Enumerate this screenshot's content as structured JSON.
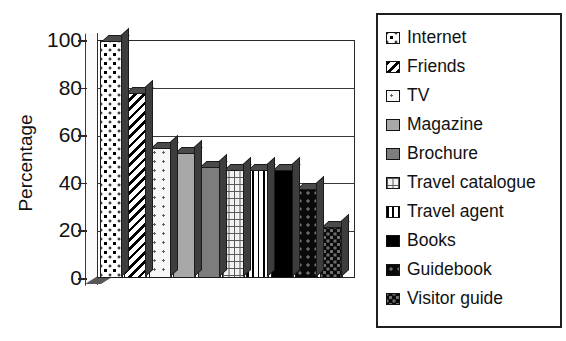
{
  "chart_data": {
    "type": "bar",
    "title": "",
    "xlabel": "",
    "ylabel": "Percentage",
    "ylim": [
      0,
      100
    ],
    "yticks": [
      0,
      20,
      40,
      60,
      80,
      100
    ],
    "grid": true,
    "legend_position": "right",
    "categories": [
      "Internet",
      "Friends",
      "TV",
      "Magazine",
      "Brochure",
      "Travel catalogue",
      "Travel agent",
      "Books",
      "Guidebook",
      "Visitor guide"
    ],
    "values": [
      100,
      78,
      55,
      53,
      47,
      46,
      46,
      46,
      38,
      22
    ]
  },
  "axis": {
    "y_title": "Percentage",
    "tick_labels": [
      "100",
      "80",
      "60",
      "40",
      "20",
      "0"
    ]
  },
  "legend": {
    "items": [
      {
        "label": "Internet",
        "pattern": "dot-cross",
        "swatch_class": "p-internet"
      },
      {
        "label": "Friends",
        "pattern": "diagonal-hatch",
        "swatch_class": "p-friends"
      },
      {
        "label": "TV",
        "pattern": "sparse-dots",
        "swatch_class": "p-tv"
      },
      {
        "label": "Magazine",
        "pattern": "solid-gray",
        "swatch_class": "p-magazine"
      },
      {
        "label": "Brochure",
        "pattern": "solid-dark-gray",
        "swatch_class": "p-brochure"
      },
      {
        "label": "Travel catalogue",
        "pattern": "brick",
        "swatch_class": "p-travelcat"
      },
      {
        "label": "Travel agent",
        "pattern": "vertical-stripe",
        "swatch_class": "p-travelagent"
      },
      {
        "label": "Books",
        "pattern": "solid-black",
        "swatch_class": "p-books"
      },
      {
        "label": "Guidebook",
        "pattern": "black-dots",
        "swatch_class": "p-guidebook"
      },
      {
        "label": "Visitor guide",
        "pattern": "black-checker",
        "swatch_class": "p-visitor"
      }
    ]
  },
  "colors": {
    "axis": "#2a2a2a",
    "grid": "#3a3a3a",
    "text": "#111111",
    "background": "#ffffff"
  }
}
